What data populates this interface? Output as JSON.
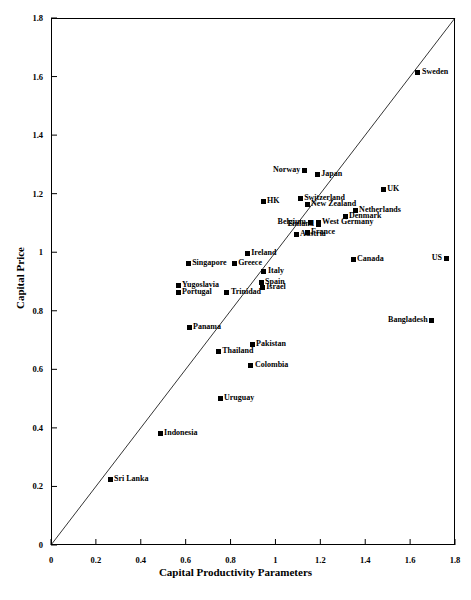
{
  "chart_data": {
    "type": "scatter",
    "title": "",
    "xlabel": "Capital Productivity Parameters",
    "ylabel": "Capital Price",
    "xlim": [
      0,
      1.8
    ],
    "ylim": [
      0,
      1.8
    ],
    "xticks": [
      "0",
      "0.2",
      "0.4",
      "0.6",
      "0.8",
      "1",
      "1.2",
      "1.4",
      "1.6",
      "1.8"
    ],
    "yticks": [
      "0",
      "0.2",
      "0.4",
      "0.6",
      "0.8",
      "1",
      "1.2",
      "1.4",
      "1.6",
      "1.8"
    ],
    "grid": false,
    "legend": "none",
    "reference_line": {
      "name": "y = x diagonal",
      "from": [
        0,
        0
      ],
      "to": [
        1.8,
        1.8
      ]
    },
    "points": [
      {
        "label": "Sweden",
        "x": 1.635,
        "y": 1.615,
        "side": "right"
      },
      {
        "label": "Norway",
        "x": 1.128,
        "y": 1.278,
        "side": "left"
      },
      {
        "label": "Japan",
        "x": 1.186,
        "y": 1.265,
        "side": "right"
      },
      {
        "label": "UK",
        "x": 1.48,
        "y": 1.213,
        "side": "right"
      },
      {
        "label": "HK",
        "x": 0.945,
        "y": 1.172,
        "side": "right"
      },
      {
        "label": "Switzerland",
        "x": 1.11,
        "y": 1.182,
        "side": "right"
      },
      {
        "label": "New Zealand",
        "x": 1.141,
        "y": 1.162,
        "side": "right"
      },
      {
        "label": "Netherlands",
        "x": 1.355,
        "y": 1.141,
        "side": "right"
      },
      {
        "label": "Denmark",
        "x": 1.31,
        "y": 1.121,
        "side": "right"
      },
      {
        "label": "Belgium",
        "x": 1.154,
        "y": 1.103,
        "side": "left"
      },
      {
        "label": "West Germany",
        "x": 1.19,
        "y": 1.103,
        "side": "right"
      },
      {
        "label": "Finland",
        "x": 1.19,
        "y": 1.093,
        "side": "left"
      },
      {
        "label": "France",
        "x": 1.141,
        "y": 1.069,
        "side": "right"
      },
      {
        "label": "Austria",
        "x": 1.092,
        "y": 1.062,
        "side": "right"
      },
      {
        "label": "Canada",
        "x": 1.346,
        "y": 0.974,
        "side": "right"
      },
      {
        "label": "US",
        "x": 1.76,
        "y": 0.977,
        "side": "left"
      },
      {
        "label": "Ireland",
        "x": 0.874,
        "y": 0.994,
        "side": "right"
      },
      {
        "label": "Greece",
        "x": 0.816,
        "y": 0.963,
        "side": "right"
      },
      {
        "label": "Singapore",
        "x": 0.611,
        "y": 0.963,
        "side": "right"
      },
      {
        "label": "Italy",
        "x": 0.949,
        "y": 0.935,
        "side": "right"
      },
      {
        "label": "Spain",
        "x": 0.936,
        "y": 0.895,
        "side": "right"
      },
      {
        "label": "Israel",
        "x": 0.941,
        "y": 0.881,
        "side": "right"
      },
      {
        "label": "Yugoslavia",
        "x": 0.566,
        "y": 0.885,
        "side": "right"
      },
      {
        "label": "Portugal",
        "x": 0.566,
        "y": 0.864,
        "side": "right"
      },
      {
        "label": "Trinidad",
        "x": 0.784,
        "y": 0.864,
        "side": "right"
      },
      {
        "label": "Bangladesh",
        "x": 1.696,
        "y": 0.766,
        "side": "left"
      },
      {
        "label": "Panama",
        "x": 0.615,
        "y": 0.742,
        "side": "right"
      },
      {
        "label": "Pakistan",
        "x": 0.896,
        "y": 0.684,
        "side": "right"
      },
      {
        "label": "Thailand",
        "x": 0.745,
        "y": 0.66,
        "side": "right"
      },
      {
        "label": "Colombia",
        "x": 0.891,
        "y": 0.612,
        "side": "right"
      },
      {
        "label": "Uruguay",
        "x": 0.753,
        "y": 0.502,
        "side": "right"
      },
      {
        "label": "Indonesia",
        "x": 0.486,
        "y": 0.38,
        "side": "right"
      },
      {
        "label": "Sri Lanka",
        "x": 0.263,
        "y": 0.223,
        "side": "right"
      }
    ]
  }
}
